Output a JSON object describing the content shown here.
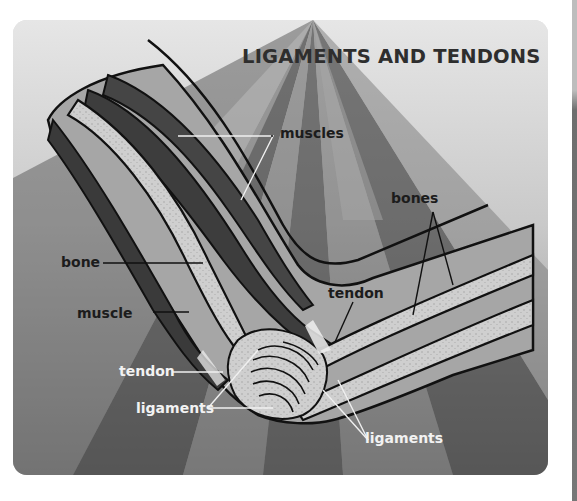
{
  "diagram": {
    "title": "LIGAMENTS AND TENDONS",
    "labels": {
      "muscles": "muscles",
      "bones": "bones",
      "bone": "bone",
      "tendon_upper": "tendon",
      "muscle": "muscle",
      "tendon_lower": "tendon",
      "ligaments_left": "ligaments",
      "ligaments_right": "ligaments"
    },
    "colors": {
      "background_light": "#e3e3e3",
      "ray_mid": "#9a9a9a",
      "ray_dark": "#4a4a4a",
      "skin": "#a9a9a9",
      "muscle": "#3d3d3d",
      "bone": "#d0d0d0",
      "outline": "#111111",
      "title_text": "#2e2e2e"
    }
  }
}
